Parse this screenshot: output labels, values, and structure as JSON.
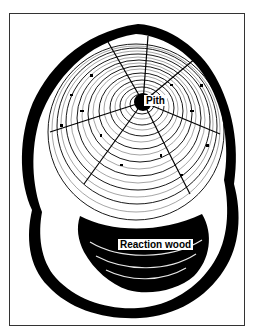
{
  "figure": {
    "labels": {
      "pith": "Pith",
      "reaction_wood": "Reaction wood"
    },
    "colors": {
      "ink": "#000000",
      "paper": "#ffffff",
      "border": "#333333"
    }
  }
}
